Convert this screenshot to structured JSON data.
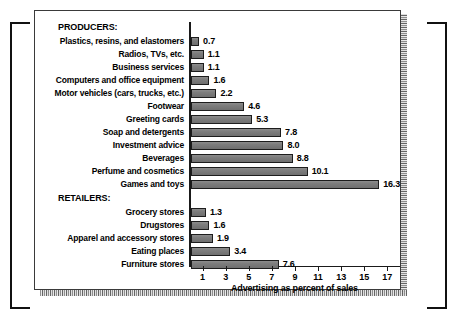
{
  "chart_data": {
    "type": "bar",
    "orientation": "horizontal",
    "title": "",
    "xlabel": "Advertising as percent of sales",
    "ylabel": "",
    "xlim": [
      0,
      18
    ],
    "xticks": [
      1,
      3,
      5,
      7,
      9,
      11,
      13,
      15,
      17
    ],
    "grid": false,
    "legend": null,
    "groups": [
      {
        "name": "PRODUCERS:",
        "categories": [
          "Plastics, resins, and elastomers",
          "Radios, TVs, etc.",
          "Business services",
          "Computers and office equipment",
          "Motor vehicles (cars, trucks, etc.)",
          "Footwear",
          "Greeting cards",
          "Soap and detergents",
          "Investment advice",
          "Beverages",
          "Perfume and cosmetics",
          "Games and toys"
        ],
        "values": [
          0.7,
          1.1,
          1.1,
          1.6,
          2.2,
          4.6,
          5.3,
          7.8,
          8.0,
          8.8,
          10.1,
          16.3
        ],
        "value_labels": [
          "0.7",
          "1.1",
          "1.1",
          "1.6",
          "2.2",
          "4.6",
          "5.3",
          "7.8",
          "8.0",
          "8.8",
          "10.1",
          "16.3"
        ]
      },
      {
        "name": "RETAILERS:",
        "categories": [
          "Grocery stores",
          "Drugstores",
          "Apparel and accessory stores",
          "Eating places",
          "Furniture stores"
        ],
        "values": [
          1.3,
          1.6,
          1.9,
          3.4,
          7.6
        ],
        "value_labels": [
          "1.3",
          "1.6",
          "1.9",
          "3.4",
          "7.6"
        ]
      }
    ]
  },
  "colors": {
    "bar_fill": "#7d7d7d",
    "bar_outline": "#1d1d1d",
    "axis": "#1a1a1a",
    "text": "#000000",
    "panel_border": "#3a3a3a",
    "background": "#ffffff"
  }
}
